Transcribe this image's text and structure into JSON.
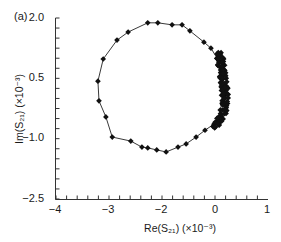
{
  "figure": {
    "panel_label": "(a)",
    "xlabel": "Re(S₂₁) (×10⁻³)",
    "ylabel": "Im(S₂₁) (×10⁻³)",
    "xticks": [
      {
        "label": "−4",
        "px": 55
      },
      {
        "label": "−3",
        "px": 108
      },
      {
        "label": "−2",
        "px": 161
      },
      {
        "label": "0",
        "px": 215
      },
      {
        "label": "1",
        "px": 267
      }
    ],
    "yticks": [
      {
        "label": "2.0",
        "py": 18
      },
      {
        "label": "0.5",
        "py": 78
      },
      {
        "label": "−1.0",
        "py": 138
      },
      {
        "label": "−2.5",
        "py": 199
      }
    ]
  },
  "chart_data": {
    "type": "scatter",
    "title": "",
    "panel": "(a)",
    "xlabel": "Re(S21) (×10^-3)",
    "ylabel": "Im(S21) (×10^-3)",
    "xlim": [
      -4,
      1
    ],
    "ylim": [
      -2.5,
      2.0
    ],
    "xtick_labels": [
      "-4",
      "-3",
      "-2",
      "0",
      "1"
    ],
    "ytick_labels": [
      "2.0",
      "0.5",
      "-1.0",
      "-2.5"
    ],
    "grid": false,
    "legend": null,
    "markers": "filled diamonds connected by line",
    "series": [
      {
        "name": "S21 locus",
        "x": [
          0.13,
          0.17,
          0.1,
          0.12,
          0.08,
          0.04,
          -0.04,
          -0.37,
          -0.7,
          -1.07,
          -1.37,
          -1.81,
          -2.08,
          -2.25,
          -2.36,
          -2.57,
          -2.92,
          -3.04,
          -3.17,
          -3.19,
          -3.09,
          -2.83,
          -2.62,
          -2.25,
          -2.06,
          -1.59,
          -1.22,
          -0.93,
          -0.41,
          -0.15,
          0.04,
          0.13
        ],
        "y": [
          0.58,
          0.08,
          -0.29,
          -0.45,
          -0.55,
          -0.6,
          -0.64,
          -0.79,
          -0.96,
          -1.13,
          -1.21,
          -1.33,
          -1.28,
          -1.23,
          -1.21,
          -1.06,
          -0.96,
          -0.46,
          -0.06,
          0.43,
          0.98,
          1.45,
          1.65,
          1.88,
          1.88,
          1.83,
          1.83,
          1.68,
          1.4,
          1.25,
          1.0,
          0.58
        ]
      }
    ]
  }
}
